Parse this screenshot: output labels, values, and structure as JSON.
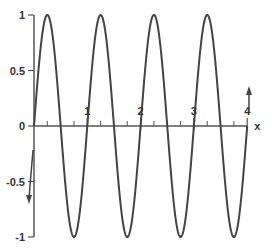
{
  "chart_data": {
    "type": "line",
    "title": "",
    "xlabel": "x",
    "ylabel": "",
    "function": "y = sin(2*pi*x)",
    "xlim": [
      0,
      4
    ],
    "ylim": [
      -1,
      1
    ],
    "grid": false,
    "x_ticks": [
      1,
      2,
      3,
      4
    ],
    "x_tick_labels": [
      "1",
      "2",
      "3",
      "4"
    ],
    "x_minor_ticks": [
      0.25,
      0.5,
      0.75,
      1.25,
      1.5,
      1.75,
      2.25,
      2.5,
      2.75,
      3.25,
      3.5,
      3.75
    ],
    "y_ticks": [
      1,
      0.5,
      0,
      -0.5,
      -1
    ],
    "y_tick_labels": [
      "1",
      "0.5",
      "0",
      "-0.5",
      "-1"
    ],
    "series": [
      {
        "name": "sin(2πx)",
        "color": "#444444",
        "x": [
          0,
          0.25,
          0.5,
          0.75,
          1,
          1.25,
          1.5,
          1.75,
          2,
          2.25,
          2.5,
          2.75,
          3,
          3.25,
          3.5,
          3.75,
          4
        ],
        "values": [
          0,
          1,
          0,
          -1,
          0,
          1,
          0,
          -1,
          0,
          1,
          0,
          -1,
          0,
          1,
          0,
          -1,
          0
        ]
      }
    ],
    "annotations": [
      {
        "type": "arrow",
        "direction": "down",
        "near_x": -0.1,
        "near_y": -0.7
      },
      {
        "type": "arrow",
        "direction": "up",
        "near_x": 4.02,
        "near_y": 0.3
      }
    ],
    "axis_color": "#555555"
  }
}
